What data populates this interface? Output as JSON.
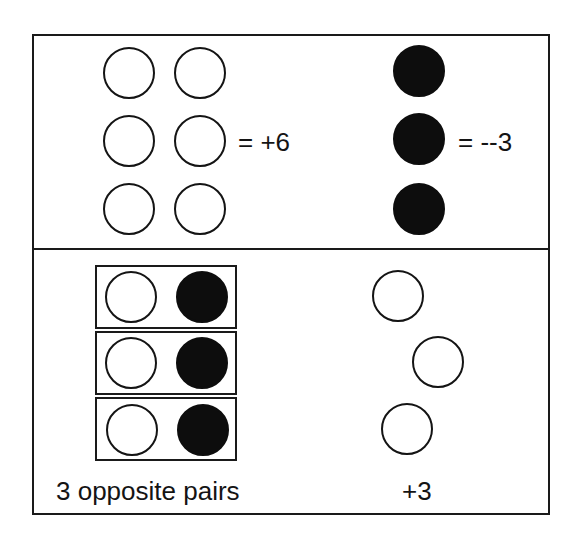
{
  "top_panel": {
    "positive_group": {
      "count": 6,
      "layout": "3 rows x 2 columns",
      "chip_type": "positive (white circle)",
      "label": "= +6"
    },
    "negative_group": {
      "count": 3,
      "layout": "1 column x 3 rows",
      "chip_type": "negative (black circle)",
      "label": "= --3"
    }
  },
  "bottom_panel": {
    "pairs": {
      "count": 3,
      "each": [
        "positive",
        "negative"
      ],
      "label": "3 opposite pairs"
    },
    "remaining": {
      "count": 3,
      "chip_type": "positive (white circle)",
      "label": "+3"
    }
  },
  "colors": {
    "positive_fill": "#ffffff",
    "negative_fill": "#0d0d0d",
    "stroke": "#1a1a1a"
  }
}
